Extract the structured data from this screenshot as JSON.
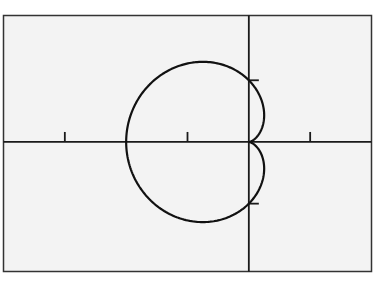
{
  "chart_data": {
    "type": "line",
    "title": "",
    "xlabel": "",
    "ylabel": "",
    "equation": "r = 1 - cos(theta)",
    "curve_kind": "polar cardioid",
    "xlim": [
      -4.0,
      2.0
    ],
    "ylim": [
      -2.1,
      2.05
    ],
    "x_ticks": [
      -3,
      -1,
      1
    ],
    "y_ticks": [
      -1,
      1
    ],
    "grid": false,
    "legend": null,
    "key_points": [
      {
        "label": "cusp",
        "x": 0,
        "y": 0
      },
      {
        "label": "leftmost",
        "x": -2,
        "y": 0
      },
      {
        "label": "top",
        "x": -0.75,
        "y": 1.299
      },
      {
        "label": "bottom",
        "x": -0.75,
        "y": -1.299
      },
      {
        "label": "upper y-intercept",
        "x": 0,
        "y": 1
      },
      {
        "label": "lower y-intercept",
        "x": 0,
        "y": -1
      }
    ],
    "colors": {
      "background": "#f3f3f3",
      "frame": "#333333",
      "axes": "#1a1a1a",
      "curve": "#111111"
    }
  }
}
